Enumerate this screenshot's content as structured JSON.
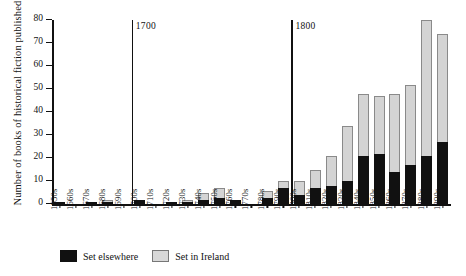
{
  "chart_data": {
    "type": "bar",
    "title": "",
    "subtitle": "",
    "xlabel": "",
    "ylabel": "Number of books of historical fiction published",
    "ylim": [
      0,
      80
    ],
    "yticks": [
      0,
      10,
      20,
      30,
      40,
      50,
      60,
      70,
      80
    ],
    "ytick_labels": [
      "0",
      "10",
      "20",
      "30",
      "40",
      "50",
      "60",
      "70",
      "80"
    ],
    "grid": false,
    "stacked": true,
    "legend_position": "bottom-left",
    "categories": [
      "1650s",
      "1660s",
      "1670s",
      "1680s",
      "1690s",
      "1700s",
      "1710s",
      "1720s",
      "1730s",
      "1740s",
      "1750s",
      "1760s",
      "1770s",
      "1780s",
      "1790s",
      "1800s",
      "1810s",
      "1820s",
      "1830s",
      "1840s",
      "1850s",
      "1860s",
      "1870s",
      "1880s",
      "1890s"
    ],
    "series": [
      {
        "name": "Set elsewhere",
        "color": "#111111",
        "values": [
          1,
          0,
          1,
          1,
          0,
          2,
          0,
          1,
          1,
          2,
          3,
          2,
          0,
          3,
          7,
          4,
          7,
          8,
          10,
          21,
          22,
          14,
          17,
          21,
          27
        ]
      },
      {
        "name": "Set in Ireland",
        "color": "#d4d4d4",
        "values": [
          0,
          0,
          0,
          1,
          0,
          0,
          0,
          0,
          1,
          3,
          4,
          0,
          0,
          3,
          3,
          6,
          8,
          13,
          24,
          27,
          25,
          34,
          35,
          59,
          47
        ]
      }
    ],
    "totals": [
      1,
      0,
      1,
      2,
      0,
      2,
      0,
      1,
      2,
      5,
      7,
      2,
      0,
      6,
      10,
      10,
      15,
      21,
      34,
      48,
      47,
      48,
      52,
      80,
      74
    ],
    "annotations": [
      {
        "label": "1700",
        "at_category": "1700s",
        "type": "century-marker"
      },
      {
        "label": "1800",
        "at_category": "1800s",
        "type": "century-marker"
      }
    ]
  },
  "legend": {
    "items": [
      {
        "label": "Set elsewhere",
        "swatch": "black-square-icon"
      },
      {
        "label": "Set in Ireland",
        "swatch": "gray-square-icon"
      }
    ]
  }
}
